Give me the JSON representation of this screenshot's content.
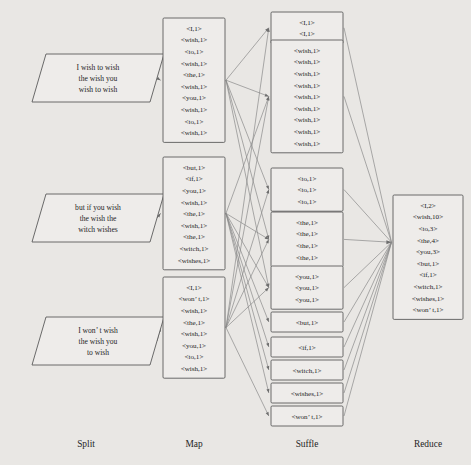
{
  "diagram": {
    "background_color": "#e9e7e4",
    "box_fill": "#eeecea",
    "box_stroke": "#5b5b5b",
    "line_color": "#8a8a8a",
    "text_color": "#262626"
  },
  "stages": [
    {
      "id": "split",
      "label": "Split"
    },
    {
      "id": "map",
      "label": "Map"
    },
    {
      "id": "shuffle",
      "label": "Suffle"
    },
    {
      "id": "reduce",
      "label": "Reduce"
    }
  ],
  "split": {
    "nodes": [
      {
        "id": "split-1",
        "lines": [
          "I wish to wish",
          "the wish you",
          "wish to wish"
        ]
      },
      {
        "id": "split-2",
        "lines": [
          "but if you wish",
          "the wish the",
          "witch wishes"
        ]
      },
      {
        "id": "split-3",
        "lines": [
          "I won’ t wish",
          "the wish you",
          "to wish"
        ]
      }
    ]
  },
  "map": {
    "nodes": [
      {
        "id": "map-1",
        "rows": [
          "<I,1>",
          "<wish,1>",
          "<to,1>",
          "<wish,1>",
          "<the,1>",
          "<wish,1>",
          "<you,1>",
          "<wish,1>",
          "<to,1>",
          "<wish,1>"
        ]
      },
      {
        "id": "map-2",
        "rows": [
          "<but,1>",
          "<if,1>",
          "<you,1>",
          "<wish,1>",
          "<the,1>",
          "<wish,1>",
          "<the,1>",
          "<witch,1>",
          "<wishes,1>"
        ]
      },
      {
        "id": "map-3",
        "rows": [
          "<I,1>",
          "<won’ t,1>",
          "<wish,1>",
          "<the,1>",
          "<wish,1>",
          "<you,1>",
          "<to,1>",
          "<wish,1>"
        ]
      }
    ]
  },
  "shuffle": {
    "nodes": [
      {
        "id": "shuffle-I",
        "rows": [
          "<I,1>",
          "<I,1>"
        ]
      },
      {
        "id": "shuffle-wish",
        "rows": [
          "<wish,1>",
          "<wish,1>",
          "<wish,1>",
          "<wish,1>",
          "<wish,1>",
          "<wish,1>",
          "<wish,1>",
          "<wish,1>",
          "<wish,1>"
        ]
      },
      {
        "id": "shuffle-to",
        "rows": [
          "<to,1>",
          "<to,1>",
          "<to,1>"
        ]
      },
      {
        "id": "shuffle-the",
        "rows": [
          "<the,1>",
          "<the,1>",
          "<the,1>",
          "<the,1>"
        ]
      },
      {
        "id": "shuffle-you",
        "rows": [
          "<you,1>",
          "<you,1>",
          "<you,1>"
        ]
      },
      {
        "id": "shuffle-but",
        "rows": [
          "<but,1>"
        ]
      },
      {
        "id": "shuffle-if",
        "rows": [
          "<if,1>"
        ]
      },
      {
        "id": "shuffle-witch",
        "rows": [
          "<witch,1>"
        ]
      },
      {
        "id": "shuffle-wishes",
        "rows": [
          "<wishes,1>"
        ]
      },
      {
        "id": "shuffle-wont",
        "rows": [
          "<won’ t,1>"
        ]
      }
    ]
  },
  "reduce": {
    "nodes": [
      {
        "id": "reduce-1",
        "rows": [
          "<I,2>",
          "<wish,10>",
          "<to,3>",
          "<the,4>",
          "<you,3>",
          "<but,1>",
          "<if,1>",
          "<witch,1>",
          "<wishes,1>",
          "<won’ t,1>"
        ]
      }
    ]
  },
  "chart_data": {
    "type": "diagram",
    "word_counts": {
      "I": 2,
      "wish": 10,
      "to": 3,
      "the": 4,
      "you": 3,
      "but": 1,
      "if": 1,
      "witch": 1,
      "wishes": 1,
      "won’t": 1
    }
  }
}
